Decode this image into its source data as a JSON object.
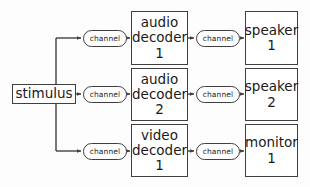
{
  "diagram": {
    "type": "block-flow-diagram",
    "background_color": "#fdfdfd",
    "stroke_color": "#3f3f3f",
    "text_color": "#1a1a1a",
    "source": {
      "label": "stimulus"
    },
    "rows": [
      {
        "channel_in": "channel",
        "processor_lines": [
          "audio",
          "decoder",
          "1"
        ],
        "channel_out": "channel",
        "sink_lines": [
          "speaker",
          "1"
        ]
      },
      {
        "channel_in": "channel",
        "processor_lines": [
          "audio",
          "decoder",
          "2"
        ],
        "channel_out": "channel",
        "sink_lines": [
          "speaker",
          "2"
        ]
      },
      {
        "channel_in": "channel",
        "processor_lines": [
          "video",
          "decoder",
          "1"
        ],
        "channel_out": "channel",
        "sink_lines": [
          "monitor",
          "1"
        ]
      }
    ]
  }
}
